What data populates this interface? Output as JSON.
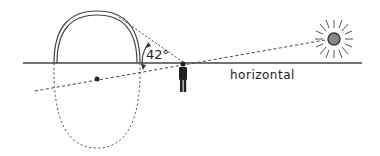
{
  "diagram": {
    "type": "rainbow-geometry",
    "labels": {
      "angle": "42°",
      "horizontal": "horizontal"
    },
    "elements": [
      "rainbow-arc",
      "rainbow-cone-circle",
      "antisolar-point",
      "observer",
      "sun",
      "horizon-line",
      "sunlight-ray",
      "sight-line"
    ],
    "colors": {
      "line": "#333333",
      "sun_fill": "#777777"
    }
  }
}
